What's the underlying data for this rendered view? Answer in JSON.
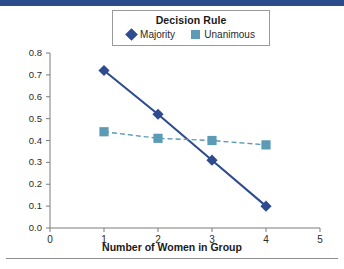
{
  "chart_data": {
    "type": "line",
    "title": "",
    "xlabel": "Number of Women in Group",
    "ylabel": "",
    "xlim": [
      0,
      5
    ],
    "ylim": [
      0.0,
      0.8
    ],
    "xticks": [
      "0",
      "1",
      "2",
      "3",
      "4",
      "5"
    ],
    "yticks": [
      "0.0",
      "0.1",
      "0.2",
      "0.3",
      "0.4",
      "0.5",
      "0.6",
      "0.7",
      "0.8"
    ],
    "grid": false,
    "legend_position": "top-center",
    "legend_title": "Decision Rule",
    "x": [
      1,
      2,
      3,
      4
    ],
    "series": [
      {
        "name": "Majority",
        "values": [
          0.72,
          0.52,
          0.31,
          0.1
        ],
        "color": "#2d4b8e",
        "marker": "diamond",
        "linestyle": "solid"
      },
      {
        "name": "Unanimous",
        "values": [
          0.44,
          0.41,
          0.4,
          0.38
        ],
        "color": "#5b9bb5",
        "marker": "square",
        "linestyle": "dashed"
      }
    ]
  },
  "legend": {
    "title": "Decision Rule",
    "entries": [
      {
        "label": "Majority",
        "marker": "diamond-marker-icon"
      },
      {
        "label": "Unanimous",
        "marker": "square-marker-icon"
      }
    ]
  },
  "axes": {
    "x_title": "Number of Women in Group"
  },
  "colors": {
    "majority": "#2d4b8e",
    "unanimous": "#5b9bb5",
    "top_rule": "#2b4b8c",
    "axis": "#7a7a7a"
  }
}
